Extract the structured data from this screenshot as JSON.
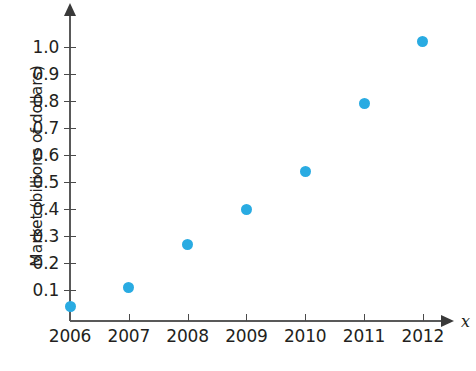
{
  "chart_data": {
    "type": "scatter",
    "title": "",
    "subtitle": "",
    "xlabel": "x",
    "ylabel": "Market (billions of dollars)",
    "categories": [
      "2006",
      "2007",
      "2008",
      "2009",
      "2010",
      "2011",
      "2012"
    ],
    "x": [
      2006,
      2007,
      2008,
      2009,
      2010,
      2011,
      2012
    ],
    "values": [
      0.04,
      0.11,
      0.27,
      0.4,
      0.54,
      0.79,
      1.02
    ],
    "series": [
      {
        "name": "Market",
        "values": [
          0.04,
          0.11,
          0.27,
          0.4,
          0.54,
          0.79,
          1.02
        ]
      }
    ],
    "xlim": [
      2006,
      2012
    ],
    "ylim": [
      0.0,
      1.05
    ],
    "y_ticks": [
      "0.1",
      "0.2",
      "0.3",
      "0.4",
      "0.5",
      "0.6",
      "0.7",
      "0.8",
      "0.9",
      "1.0"
    ],
    "y_tick_values": [
      0.1,
      0.2,
      0.3,
      0.4,
      0.5,
      0.6,
      0.7,
      0.8,
      0.9,
      1.0
    ],
    "x_ticks": [
      "2006",
      "2007",
      "2008",
      "2009",
      "2010",
      "2011",
      "2012"
    ],
    "grid": false,
    "legend": false,
    "legend_position": "none",
    "annotations": [],
    "marker_color": "#29abe2",
    "axis_color": "#595959",
    "text_color": "#231f20",
    "background_color": "#ffffff"
  },
  "axes": {
    "y_axis_label": "Market (billions of dollars)",
    "x_axis_label": "x",
    "y_axis_has_arrow": true,
    "x_axis_has_arrow": true
  }
}
